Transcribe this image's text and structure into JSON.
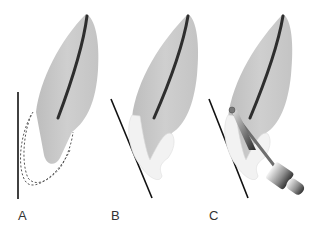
{
  "figure": {
    "panels": [
      {
        "id": "A",
        "label": "A",
        "description": "tooth with dashed outline of apical region and vertical reference line"
      },
      {
        "id": "B",
        "label": "B",
        "description": "tooth with resected apex filled (light) and angled reference line"
      },
      {
        "id": "C",
        "label": "C",
        "description": "tooth with angled line and rotary handpiece bur preparing root-end"
      }
    ],
    "colors": {
      "tooth": "#c8c8c8",
      "canal": "#3a3a3a",
      "filling": "#f0f0f0",
      "line": "#111111",
      "dashed": "#555555"
    }
  }
}
